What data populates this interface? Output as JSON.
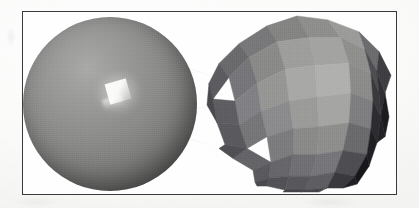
{
  "figure": {
    "kind": "scanned-textbook-illustration",
    "caption_text": "",
    "frame": {
      "border_color": "#3a3a3c",
      "background_color": "#fefefe"
    },
    "page_background_color": "#fdfdfc"
  },
  "objects": [
    {
      "id": "smooth-sphere",
      "label": "smooth-shaded sphere",
      "shading_model": "smooth (Gouraud/Phong interpolated)",
      "shape": "sphere",
      "base_color": "#8b8b8a",
      "highlight_color": "#ffffff",
      "shadow_color": "#3b3b3c",
      "highlight": {
        "description": "blocky low-resolution specular highlight",
        "position": "upper-left of sphere"
      }
    },
    {
      "id": "flat-polyhedron",
      "label": "flat-shaded faceted sphere",
      "shading_model": "flat (per-facet constant shading)",
      "shape": "geodesic polyhedron approximating a sphere",
      "facet_count_visible": 60,
      "lightest_facet_color": "#b0b0ae",
      "darkest_facet_color": "#17171a",
      "light_direction": "upper-left"
    }
  ],
  "chart_data": {
    "type": "table",
    "categories": [
      "smooth-shaded sphere",
      "flat-shaded faceted sphere"
    ],
    "values": [
      1,
      60
    ],
    "xlabel": "render object",
    "ylabel": "visible shading regions",
    "annotations": [
      "left: continuous tonal gradient with a single specular highlight",
      "right: discrete constant-tone polygonal facets, no interpolation"
    ]
  },
  "polyhedron_facets": [
    {
      "points": "96,2 127,6 140,24 108,24",
      "fill": "#8e8e8c"
    },
    {
      "points": "127,6 158,18 164,36 140,24",
      "fill": "#9b9b99"
    },
    {
      "points": "96,2 108,24 76,28 66,12",
      "fill": "#848482"
    },
    {
      "points": "66,12 76,28 48,44 38,30",
      "fill": "#78787a"
    },
    {
      "points": "158,18 178,38 176,58 164,36",
      "fill": "#6c6c6e"
    },
    {
      "points": "38,30 48,44 28,64 18,50",
      "fill": "#6a6a6c"
    },
    {
      "points": "108,24 140,24 148,50 114,52",
      "fill": "#a3a3a1"
    },
    {
      "points": "140,24 164,36 170,60 148,50",
      "fill": "#8f8f8d"
    },
    {
      "points": "76,28 108,24 114,52 84,56",
      "fill": "#9e9e9c"
    },
    {
      "points": "48,44 76,28 84,56 56,70",
      "fill": "#8a8a88"
    },
    {
      "points": "164,36 176,58 178,80 170,60",
      "fill": "#4e4e52"
    },
    {
      "points": "28,64 48,44 56,70 34,88",
      "fill": "#76767a"
    },
    {
      "points": "18,50 28,64 12,86 8,70",
      "fill": "#5c5c60"
    },
    {
      "points": "114,52 148,50 150,80 116,84",
      "fill": "#b0b0ae"
    },
    {
      "points": "148,50 170,60 172,88 150,80",
      "fill": "#8b8b89"
    },
    {
      "points": "84,56 114,52 116,84 88,88",
      "fill": "#a8a8a6"
    },
    {
      "points": "56,70 84,56 88,88 60,98",
      "fill": "#969694"
    },
    {
      "points": "170,60 178,80 180,104 172,88",
      "fill": "#3a3a3e"
    },
    {
      "points": "34,88 56,70 60,98 38,112",
      "fill": "#818185"
    },
    {
      "points": "12,86 34,88 38,112 16,110",
      "fill": "#5e5e62"
    },
    {
      "points": "8,70 12,86 16,110 6,92",
      "fill": "#4a4a4e"
    },
    {
      "points": "116,84 150,80 148,110 118,114",
      "fill": "#a5a5a3"
    },
    {
      "points": "150,80 172,88 170,116 148,110",
      "fill": "#7e7e80"
    },
    {
      "points": "88,88 116,84 118,114 92,116",
      "fill": "#9b9b99"
    },
    {
      "points": "60,98 88,88 92,116 66,124",
      "fill": "#8b8b8d"
    },
    {
      "points": "172,88 180,104 176,130 170,116",
      "fill": "#2c2c30"
    },
    {
      "points": "38,112 60,98 66,124 46,136",
      "fill": "#767678"
    },
    {
      "points": "16,110 38,112 46,136 24,132",
      "fill": "#5a5a5e"
    },
    {
      "points": "118,114 148,110 142,138 116,142",
      "fill": "#8e8e8c"
    },
    {
      "points": "148,110 170,116 166,142 142,138",
      "fill": "#6a6a6c"
    },
    {
      "points": "92,116 118,114 116,142 92,142",
      "fill": "#8a8a88"
    },
    {
      "points": "66,124 92,116 92,142 70,150",
      "fill": "#7c7c7e"
    },
    {
      "points": "170,116 176,130 168,154 166,142",
      "fill": "#1f1f23"
    },
    {
      "points": "46,136 70,150 52,158 32,146",
      "fill": "#646468"
    },
    {
      "points": "24,132 46,136 32,146 18,136",
      "fill": "#505054"
    },
    {
      "points": "116,142 142,138 134,160 110,164",
      "fill": "#76767a"
    },
    {
      "points": "142,138 166,142 154,164 134,160",
      "fill": "#4e4e52"
    },
    {
      "points": "92,142 116,142 110,164 88,164",
      "fill": "#707074"
    },
    {
      "points": "70,150 92,142 88,164 68,166",
      "fill": "#66666a"
    },
    {
      "points": "166,142 168,154 156,172 154,164",
      "fill": "#17171a"
    },
    {
      "points": "52,158 70,150 68,166 54,170",
      "fill": "#5a5a5e"
    },
    {
      "points": "110,164 134,160 126,176 104,178",
      "fill": "#5e5e62"
    },
    {
      "points": "134,160 154,164 142,176 126,176",
      "fill": "#3a3a3e"
    },
    {
      "points": "88,164 110,164 104,178 84,178",
      "fill": "#58585c"
    },
    {
      "points": "68,166 88,164 84,178 66,174",
      "fill": "#525256"
    },
    {
      "points": "154,164 156,172 142,176 142,176",
      "fill": "#202024"
    },
    {
      "points": "54,170 68,166 66,174 56,174",
      "fill": "#4a4a4e"
    },
    {
      "points": "104,178 126,176 118,180 100,180",
      "fill": "#46464a"
    },
    {
      "points": "84,178 104,178 100,180 82,180",
      "fill": "#444448"
    },
    {
      "points": "176,58 184,80 180,104 178,80",
      "fill": "#303034"
    },
    {
      "points": "178,38 190,62 184,80 176,58",
      "fill": "#3e3e42"
    },
    {
      "points": "180,104 184,124 176,130 176,130",
      "fill": "#222226"
    },
    {
      "points": "184,80 188,104 184,124 180,104",
      "fill": "#1c1c20"
    }
  ]
}
